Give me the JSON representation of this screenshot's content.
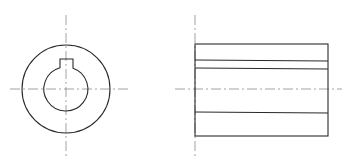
{
  "drawing": {
    "title": "",
    "colors": {
      "outline": "#2a2a2a",
      "centerline": "#8a8a8a",
      "background": "#ffffff"
    },
    "front_view": {
      "name": "end-view",
      "center": [
        66,
        89
      ],
      "outer_radius": 44,
      "bore_radius": 22,
      "keyway": {
        "x1": 60,
        "x2": 73,
        "top_y": 59
      }
    },
    "side_view": {
      "name": "side-view",
      "rect": {
        "x": 195,
        "y": 44,
        "w": 133,
        "h": 92
      },
      "hidden_lines_y": [
        60,
        68,
        112
      ],
      "centerline_y": 89
    }
  }
}
